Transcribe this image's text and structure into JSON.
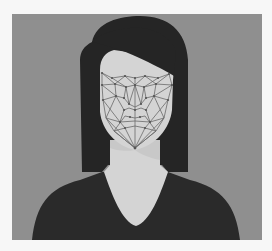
{
  "image": {
    "description": "Flat illustration of a woman with dark hair and dark top; a facial-recognition triangulated mesh overlays her face",
    "colors": {
      "page_background": "#f7f7f7",
      "backdrop": "#8f8f8f",
      "hair": "#252525",
      "skin": "#d4d4d4",
      "neck_shadow": "#c4c4c4",
      "shirt": "#2a2a2a",
      "mesh_line": "#6a6a6a",
      "mesh_node": "#555555"
    }
  }
}
